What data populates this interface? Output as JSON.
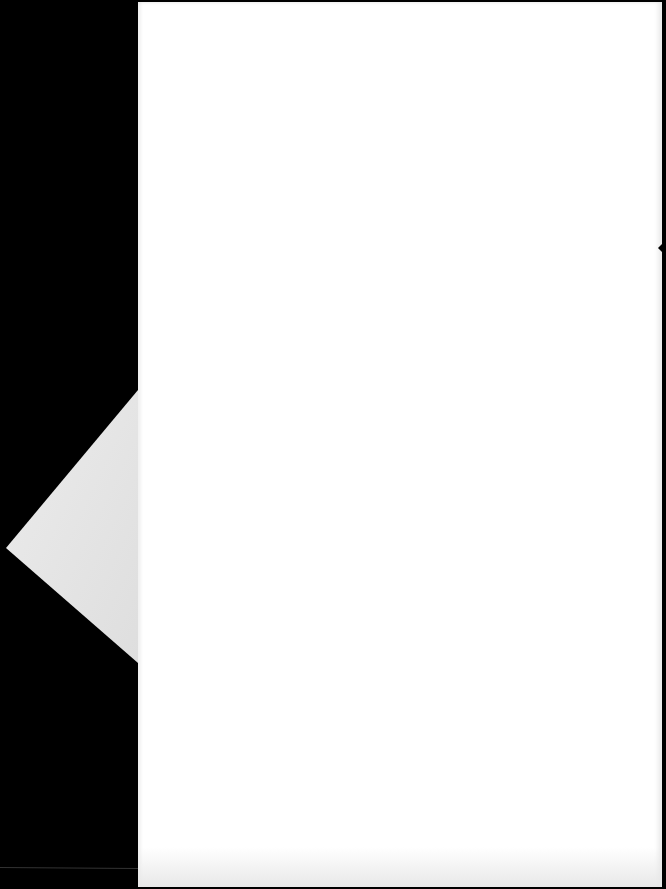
{
  "scene": {
    "description": "Scanned blank document page on black background",
    "background_color": "#000000",
    "page_color": "#ffffff",
    "folded_corner_color": "#e6e6e6"
  },
  "page": {
    "text": ""
  }
}
